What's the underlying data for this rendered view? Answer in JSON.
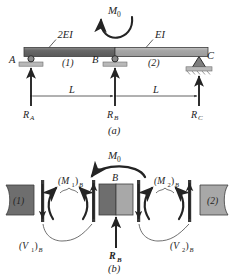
{
  "figure": {
    "panel_a": {
      "caption": "(a)",
      "beam_segments": [
        {
          "name": "segment-1",
          "label": "(1)",
          "stiffness_label": "2EI",
          "fill": "#6e6e6e"
        },
        {
          "name": "segment-2",
          "label": "(2)",
          "stiffness_label": "EI",
          "fill": "#a8a8a8"
        }
      ],
      "applied_moment": "M_0",
      "applied_moment_display": "M",
      "applied_moment_sub": "0",
      "nodes": [
        {
          "name": "node-a",
          "label": "A",
          "support": "roller",
          "reaction": "R_A",
          "reaction_display": "R",
          "reaction_sub": "A"
        },
        {
          "name": "node-b",
          "label": "B",
          "support": "roller",
          "reaction": "R_B",
          "reaction_display": "R",
          "reaction_sub": "B"
        },
        {
          "name": "node-c",
          "label": "C",
          "support": "pin",
          "reaction": "R_C",
          "reaction_display": "R",
          "reaction_sub": "C"
        }
      ],
      "dimensions": [
        {
          "name": "span-ab",
          "label": "L"
        },
        {
          "name": "span-bc",
          "label": "L"
        }
      ]
    },
    "panel_b": {
      "caption": "(b)",
      "center_label": "B",
      "applied_moment_display": "M",
      "applied_moment_sub": "0",
      "left_body_label": "(1)",
      "right_body_label": "(2)",
      "left_moment": {
        "display": "(M",
        "sub": "1",
        "tail": ")",
        "tail_sub": "B"
      },
      "right_moment": {
        "display": "(M",
        "sub": "2",
        "tail": ")",
        "tail_sub": "B"
      },
      "left_shear": {
        "display": "(V",
        "sub": "1",
        "tail": ")",
        "tail_sub": "B"
      },
      "right_shear": {
        "display": "(V",
        "sub": "2",
        "tail": ")",
        "tail_sub": "B"
      },
      "center_reaction": {
        "display": "R",
        "sub": "B"
      },
      "block_fills": {
        "left": "#6e6e6e",
        "right": "#a8a8a8"
      }
    },
    "colors": {
      "ink": "#242424",
      "beam_dark": "#6e6e6e",
      "beam_light": "#a8a8a8",
      "support_gray": "#b9b9b9",
      "hatch_gray": "#8d8d8d",
      "background": "#ffffff"
    }
  }
}
